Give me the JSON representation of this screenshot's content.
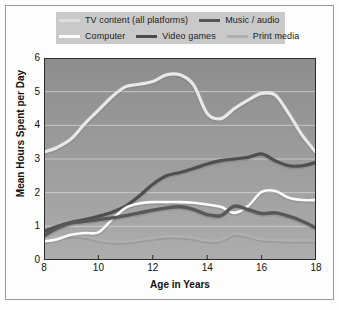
{
  "chart_data": {
    "type": "line",
    "title": "",
    "xlabel": "Age in Years",
    "ylabel": "Mean Hours Spent per Day",
    "xlim": [
      8,
      18
    ],
    "ylim": [
      0,
      6
    ],
    "xticks": [
      8,
      10,
      12,
      14,
      16,
      18
    ],
    "yticks": [
      0,
      1,
      2,
      3,
      4,
      5,
      6
    ],
    "grid": "horizontal",
    "legend_position": "top",
    "plot_background": "#9a9a9a",
    "gridline_color": "#d8d8d8",
    "x": [
      8,
      8.5,
      9,
      9.5,
      10,
      10.5,
      11,
      11.5,
      12,
      12.5,
      13,
      13.5,
      14,
      14.5,
      15,
      15.5,
      16,
      16.5,
      17,
      17.5,
      18
    ],
    "series": [
      {
        "name": "TV content (all platforms)",
        "color": "#e8e8e8",
        "width": 3.2,
        "values": [
          3.2,
          3.35,
          3.6,
          4.05,
          4.45,
          4.85,
          5.15,
          5.22,
          5.3,
          5.5,
          5.5,
          5.2,
          4.35,
          4.2,
          4.5,
          4.75,
          4.95,
          4.9,
          4.35,
          3.7,
          3.2
        ]
      },
      {
        "name": "Music / audio",
        "color": "#4f4f4f",
        "width": 3.2,
        "values": [
          0.85,
          1.0,
          1.12,
          1.2,
          1.3,
          1.42,
          1.6,
          1.9,
          2.25,
          2.5,
          2.6,
          2.72,
          2.85,
          2.95,
          3.0,
          3.05,
          3.15,
          2.95,
          2.8,
          2.8,
          2.9
        ]
      },
      {
        "name": "Computer",
        "color": "#fbfbfb",
        "width": 2.6,
        "values": [
          0.55,
          0.62,
          0.75,
          0.8,
          0.82,
          1.2,
          1.55,
          1.68,
          1.72,
          1.72,
          1.72,
          1.7,
          1.65,
          1.58,
          1.4,
          1.6,
          2.02,
          2.05,
          1.85,
          1.78,
          1.78
        ]
      },
      {
        "name": "Video games",
        "color": "#585858",
        "width": 3.4,
        "values": [
          0.72,
          0.95,
          1.1,
          1.15,
          1.2,
          1.25,
          1.32,
          1.4,
          1.48,
          1.55,
          1.58,
          1.5,
          1.35,
          1.32,
          1.6,
          1.5,
          1.38,
          1.4,
          1.3,
          1.15,
          0.95
        ]
      },
      {
        "name": "Print media",
        "color": "#b0b0b0",
        "width": 2.8,
        "values": [
          0.62,
          0.7,
          0.72,
          0.7,
          0.6,
          0.55,
          0.55,
          0.6,
          0.66,
          0.7,
          0.7,
          0.66,
          0.58,
          0.6,
          0.78,
          0.72,
          0.62,
          0.6,
          0.58,
          0.58,
          0.58
        ]
      }
    ]
  },
  "legend": {
    "row1": [
      {
        "label": "TV content (all platforms)",
        "color": "#dedede"
      },
      {
        "label": "Music / audio",
        "color": "#555555"
      }
    ],
    "row2": [
      {
        "label": "Computer",
        "color": "#fbfbfb"
      },
      {
        "label": "Video games",
        "color": "#4a4a4a"
      },
      {
        "label": "Print media",
        "color": "#aeaeae"
      }
    ]
  }
}
